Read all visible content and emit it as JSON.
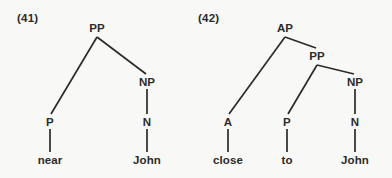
{
  "figure": {
    "background_color": "#f8f8f6",
    "ink_color": "#2b2b2b",
    "trees": [
      {
        "example_number": "(41)",
        "example_number_pos": {
          "x": 17,
          "y": 12
        },
        "nodes": [
          {
            "id": "pp",
            "label": "PP",
            "x": 97,
            "y": 28,
            "kind": "nonterminal"
          },
          {
            "id": "np",
            "label": "NP",
            "x": 147,
            "y": 82,
            "kind": "nonterminal"
          },
          {
            "id": "p",
            "label": "P",
            "x": 50,
            "y": 122,
            "kind": "nonterminal"
          },
          {
            "id": "n",
            "label": "N",
            "x": 147,
            "y": 122,
            "kind": "nonterminal"
          },
          {
            "id": "near",
            "label": "near",
            "x": 50,
            "y": 160,
            "kind": "terminal"
          },
          {
            "id": "john",
            "label": "John",
            "x": 147,
            "y": 160,
            "kind": "terminal"
          }
        ],
        "edges": [
          {
            "from": "pp",
            "to": "p",
            "x1": 97,
            "y1": 37,
            "x2": 51,
            "y2": 114
          },
          {
            "from": "pp",
            "to": "np",
            "x1": 97,
            "y1": 37,
            "x2": 146,
            "y2": 74
          },
          {
            "from": "np",
            "to": "n",
            "x1": 147,
            "y1": 89,
            "x2": 147,
            "y2": 114
          },
          {
            "from": "p",
            "to": "near",
            "x1": 50,
            "y1": 129,
            "x2": 50,
            "y2": 152
          },
          {
            "from": "n",
            "to": "john",
            "x1": 147,
            "y1": 129,
            "x2": 147,
            "y2": 152
          }
        ]
      },
      {
        "example_number": "(42)",
        "example_number_pos": {
          "x": 198,
          "y": 12
        },
        "nodes": [
          {
            "id": "ap",
            "label": "AP",
            "x": 285,
            "y": 28,
            "kind": "nonterminal"
          },
          {
            "id": "pp2",
            "label": "PP",
            "x": 317,
            "y": 56,
            "kind": "nonterminal"
          },
          {
            "id": "np2",
            "label": "NP",
            "x": 355,
            "y": 82,
            "kind": "nonterminal"
          },
          {
            "id": "a",
            "label": "A",
            "x": 228,
            "y": 122,
            "kind": "nonterminal"
          },
          {
            "id": "p2",
            "label": "P",
            "x": 287,
            "y": 122,
            "kind": "nonterminal"
          },
          {
            "id": "n2",
            "label": "N",
            "x": 355,
            "y": 122,
            "kind": "nonterminal"
          },
          {
            "id": "close",
            "label": "close",
            "x": 228,
            "y": 160,
            "kind": "terminal"
          },
          {
            "id": "to",
            "label": "to",
            "x": 287,
            "y": 160,
            "kind": "terminal"
          },
          {
            "id": "john2",
            "label": "John",
            "x": 355,
            "y": 160,
            "kind": "terminal"
          }
        ],
        "edges": [
          {
            "from": "ap",
            "to": "a",
            "x1": 285,
            "y1": 37,
            "x2": 229,
            "y2": 114
          },
          {
            "from": "ap",
            "to": "pp2",
            "x1": 285,
            "y1": 37,
            "x2": 316,
            "y2": 48
          },
          {
            "from": "pp2",
            "to": "p2",
            "x1": 317,
            "y1": 65,
            "x2": 288,
            "y2": 114
          },
          {
            "from": "pp2",
            "to": "np2",
            "x1": 317,
            "y1": 65,
            "x2": 354,
            "y2": 74
          },
          {
            "from": "np2",
            "to": "n2",
            "x1": 355,
            "y1": 89,
            "x2": 355,
            "y2": 114
          },
          {
            "from": "a",
            "to": "close",
            "x1": 228,
            "y1": 129,
            "x2": 228,
            "y2": 152
          },
          {
            "from": "p2",
            "to": "to",
            "x1": 287,
            "y1": 129,
            "x2": 287,
            "y2": 152
          },
          {
            "from": "n2",
            "to": "john2",
            "x1": 355,
            "y1": 129,
            "x2": 355,
            "y2": 152
          }
        ]
      }
    ]
  }
}
